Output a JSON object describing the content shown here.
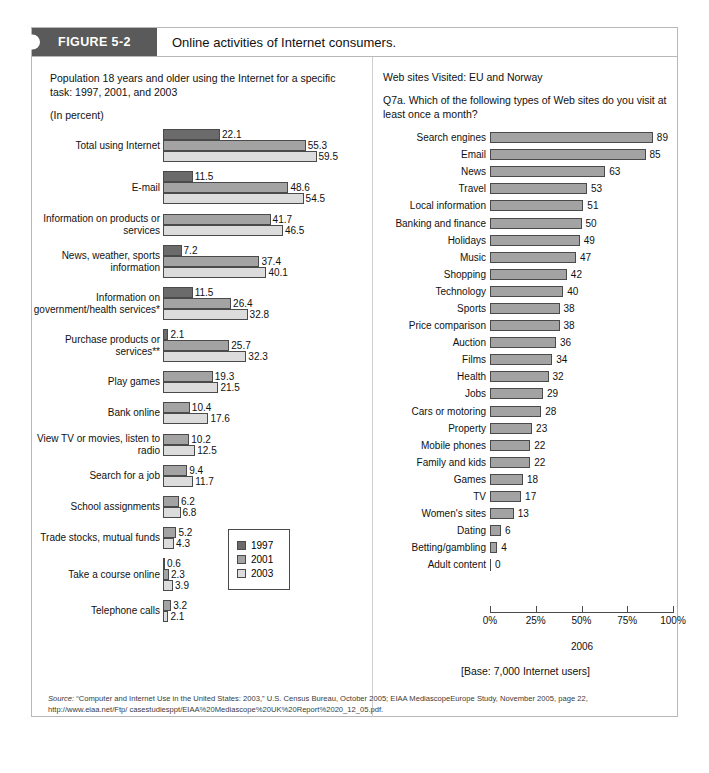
{
  "figure": {
    "tag": "FIGURE 5-2",
    "title": "Online activities of Internet consumers."
  },
  "left": {
    "heading": "Population 18 years and older using the Internet for a specific task: 1997, 2001, and 2003",
    "subheading": "(In percent)",
    "legend_title": "",
    "legend": [
      {
        "label": "1997",
        "color": "#6b6b6b"
      },
      {
        "label": "2001",
        "color": "#a3a3a3"
      },
      {
        "label": "2003",
        "color": "#dcdcdc"
      }
    ]
  },
  "right": {
    "heading": "Web sites Visited: EU and Norway",
    "question": "Q7a. Which of the following types of Web sites do you visit at least once a month?",
    "axis_caption": "2006",
    "base_note": "[Base: 7,000 Internet users]",
    "ticks": [
      "0%",
      "25%",
      "50%",
      "75%",
      "100%"
    ]
  },
  "source": {
    "label": "Source:",
    "line1": "“Computer and Internet Use in the United States: 2003,” U.S. Census Bureau, October 2005; EIAA MediascopeEurope Study, November 2005, page 22, http://www.eiaa.net/Ftp/",
    "line2": "casestudiesppt/EIAA%20Mediascope%20UK%20Report%2020_12_05.pdf."
  },
  "chart_data": [
    {
      "type": "bar",
      "title": "Population 18 years and older using the Internet for a specific task: 1997, 2001, and 2003",
      "xlabel": "",
      "ylabel": "",
      "unit": "percent",
      "orientation": "horizontal",
      "grid": false,
      "legend_position": "inside-bottom-right",
      "categories": [
        "Total using Internet",
        "E-mail",
        "Information on products or services",
        "News, weather, sports information",
        "Information on government/health services*",
        "Purchase products or services**",
        "Play games",
        "Bank online",
        "View TV or movies, listen to radio",
        "Search for a job",
        "School assignments",
        "Trade stocks, mutual funds",
        "Take a course online",
        "Telephone calls"
      ],
      "series": [
        {
          "name": "1997",
          "color": "#6b6b6b",
          "values": [
            22.1,
            11.5,
            null,
            7.2,
            11.5,
            2.1,
            null,
            null,
            null,
            null,
            null,
            null,
            0.6,
            null
          ]
        },
        {
          "name": "2001",
          "color": "#a3a3a3",
          "values": [
            55.3,
            48.6,
            41.7,
            37.4,
            26.4,
            25.7,
            19.3,
            10.4,
            10.2,
            9.4,
            6.2,
            5.2,
            2.3,
            3.2
          ]
        },
        {
          "name": "2003",
          "color": "#dcdcdc",
          "values": [
            59.5,
            54.5,
            46.5,
            40.1,
            32.8,
            32.3,
            21.5,
            17.6,
            12.5,
            11.7,
            6.8,
            4.3,
            3.9,
            2.1
          ]
        }
      ],
      "xlim": [
        0,
        60
      ]
    },
    {
      "type": "bar",
      "title": "Web sites Visited: EU and Norway",
      "subtitle": "Q7a. Which of the following types of Web sites do you visit at least once a month?",
      "xlabel": "2006",
      "ylabel": "",
      "unit": "percent",
      "orientation": "horizontal",
      "grid": false,
      "xlim": [
        0,
        100
      ],
      "xticks": [
        0,
        25,
        50,
        75,
        100
      ],
      "xticklabels": [
        "0%",
        "25%",
        "50%",
        "75%",
        "100%"
      ],
      "categories": [
        "Search engines",
        "Email",
        "News",
        "Travel",
        "Local information",
        "Banking and finance",
        "Holidays",
        "Music",
        "Shopping",
        "Technology",
        "Sports",
        "Price comparison",
        "Auction",
        "Films",
        "Health",
        "Jobs",
        "Cars or motoring",
        "Property",
        "Mobile phones",
        "Family and kids",
        "Games",
        "TV",
        "Women's sites",
        "Dating",
        "Betting/gambling",
        "Adult content"
      ],
      "values": [
        89,
        85,
        63,
        53,
        51,
        50,
        49,
        47,
        42,
        40,
        38,
        38,
        36,
        34,
        32,
        29,
        28,
        23,
        22,
        22,
        18,
        17,
        13,
        6,
        4,
        0
      ],
      "bar_color": "#a3a3a3",
      "note": "[Base: 7,000 Internet users]"
    }
  ]
}
